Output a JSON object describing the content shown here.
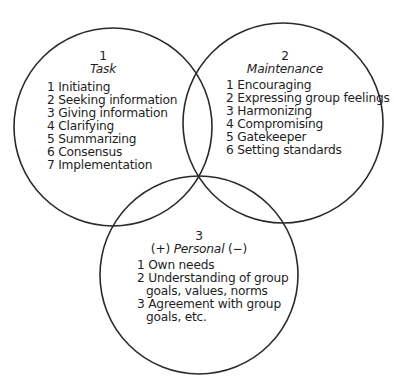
{
  "diagram": {
    "type": "venn",
    "line_color": "#2a2a2a",
    "circles": [
      {
        "id": "task",
        "number": "1",
        "heading": "Task",
        "items": [
          "1 Initiating",
          "2 Seeking information",
          "3 Giving information",
          "4 Clarifying",
          "5 Summarizing",
          "6 Consensus",
          "7 Implementation"
        ]
      },
      {
        "id": "maintenance",
        "number": "2",
        "heading": "Maintenance",
        "items": [
          "1 Encouraging",
          "2 Expressing group feelings",
          "3 Harmonizing",
          "4 Compromising",
          "5 Gatekeeper",
          "6 Setting standards"
        ]
      },
      {
        "id": "personal",
        "number": "3",
        "heading_prefix": "(+)",
        "heading": "Personal",
        "heading_suffix": "(−)",
        "items": [
          {
            "first": "1 Own needs"
          },
          {
            "first": "2 Understanding of group",
            "cont": "goals, values, norms"
          },
          {
            "first": "3 Agreement with group",
            "cont": "goals, etc."
          }
        ]
      }
    ]
  }
}
